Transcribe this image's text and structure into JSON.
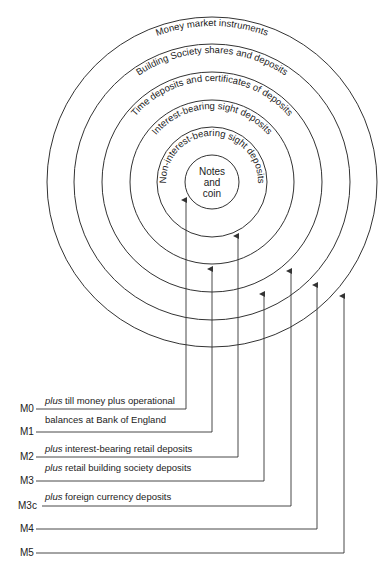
{
  "diagram": {
    "center": {
      "x": 212,
      "y": 182
    },
    "rings": [
      {
        "id": "notes-and-coin",
        "radius": 27,
        "label_lines": [
          "Notes",
          "and",
          "coin"
        ]
      },
      {
        "id": "non-interest-bearing-sight-deposits",
        "radius": 55,
        "label": "Non-interest-bearing sight deposits"
      },
      {
        "id": "interest-bearing-sight-deposits",
        "radius": 82,
        "label": "Interest-bearing sight deposits"
      },
      {
        "id": "time-deposits",
        "radius": 110,
        "label": "Time deposits and certificates of deposits"
      },
      {
        "id": "building-society",
        "radius": 138,
        "label": "Building Society shares and deposits"
      },
      {
        "id": "money-market",
        "radius": 165,
        "label": "Money market instruments"
      }
    ],
    "aggregates": [
      {
        "name": "M0",
        "x": 186,
        "y": 409,
        "tip_y": 196
      },
      {
        "name": "M1",
        "x": 212,
        "y": 432,
        "tip_y": 265
      },
      {
        "name": "M2",
        "x": 238,
        "y": 457,
        "tip_y": 232
      },
      {
        "name": "M3",
        "x": 264,
        "y": 481,
        "tip_y": 290
      },
      {
        "name": "M3c",
        "x": 291,
        "y": 506,
        "tip_y": 267
      },
      {
        "name": "M4",
        "x": 317,
        "y": 529,
        "tip_y": 281
      },
      {
        "name": "M5",
        "x": 344,
        "y": 553,
        "tip_y": 292
      }
    ],
    "notes": {
      "m0_above": {
        "plus": "plus",
        "text": " till money plus operational"
      },
      "m0_below": "balances at Bank of England",
      "m2_above": {
        "plus": "plus",
        "text": "  interest-bearing retail deposits"
      },
      "m2_below": {
        "plus": "plus",
        "text": " retail building society deposits"
      },
      "m3c_above": {
        "plus": "plus",
        "text": " foreign currency deposits"
      }
    },
    "colors": {
      "line": "#333333",
      "text": "#222222",
      "background": "#ffffff"
    }
  }
}
